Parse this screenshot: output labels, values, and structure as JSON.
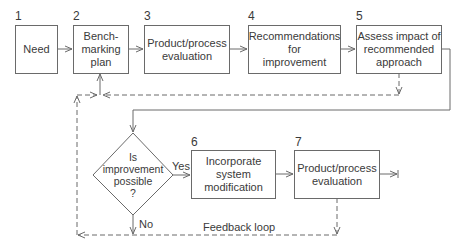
{
  "diagram": {
    "steps": [
      {
        "number": "1",
        "label": "Need"
      },
      {
        "number": "2",
        "label": "Bench-\nmarking\nplan"
      },
      {
        "number": "3",
        "label": "Product/process\nevaluation"
      },
      {
        "number": "4",
        "label": "Recommendations\nfor\nimprovement"
      },
      {
        "number": "5",
        "label": "Assess impact of\nrecommended\napproach"
      },
      {
        "number": "6",
        "label": "Incorporate\nsystem\nmodification"
      },
      {
        "number": "7",
        "label": "Product/process\nevaluation"
      }
    ],
    "decision": {
      "label": "Is\nimprovement\npossible\n?",
      "yes_label": "Yes",
      "no_label": "No"
    },
    "feedback_label": "Feedback loop",
    "colors": {
      "line": "#6a6a6a",
      "text": "#3a3a3a",
      "background": "#ffffff"
    }
  }
}
